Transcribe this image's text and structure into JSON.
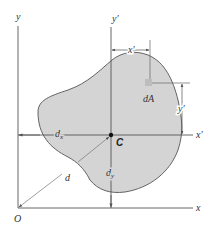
{
  "diagram": {
    "type": "centroid-parallel-axis-figure",
    "colors": {
      "shape_fill": "#d4d4d4",
      "shape_stroke": "#555555",
      "axis": "#555555",
      "dimension": "#666666",
      "element": "#bdbdbd",
      "background": "#ffffff"
    },
    "labels": {
      "y_axis": "y",
      "x_axis": "x",
      "origin": "O",
      "y_prime_axis": "y′",
      "x_prime_axis": "x′",
      "x_prime_dim": "x′",
      "y_prime_dim": "y′",
      "element": "dA",
      "centroid": "C",
      "dx_main": "d",
      "dx_sub": "x",
      "dy_main": "d",
      "dy_sub": "y",
      "d": "d"
    }
  }
}
